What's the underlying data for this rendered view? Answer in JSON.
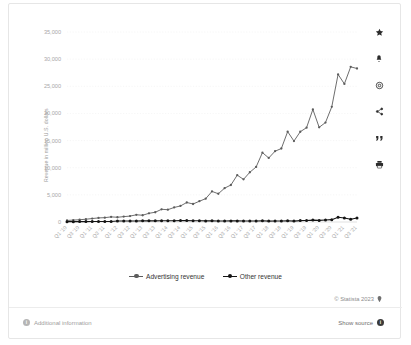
{
  "chart_data": {
    "type": "line",
    "title": "",
    "xlabel": "",
    "ylabel": "Revenue in million U.S. dollars",
    "ylim": [
      0,
      35000
    ],
    "yticks": [
      "0",
      "5,000",
      "10,000",
      "15,000",
      "20,000",
      "25,000",
      "30,000",
      "35,000"
    ],
    "ytick_values": [
      0,
      5000,
      10000,
      15000,
      20000,
      25000,
      30000,
      35000
    ],
    "grid": true,
    "legend_position": "bottom",
    "categories": [
      "Q1 '10",
      "Q2 '10",
      "Q3 '10",
      "Q4 '10",
      "Q1 '11",
      "Q2 '11",
      "Q3 '11",
      "Q4 '11",
      "Q1 '12",
      "Q2 '12",
      "Q3 '12",
      "Q4 '12",
      "Q1 '13",
      "Q2 '13",
      "Q3 '13",
      "Q4 '13",
      "Q1 '14",
      "Q2 '14",
      "Q3 '14",
      "Q4 '14",
      "Q1 '15",
      "Q2 '15",
      "Q3 '15",
      "Q4 '15",
      "Q1 '16",
      "Q2 '16",
      "Q3 '16",
      "Q4 '16",
      "Q1 '17",
      "Q2 '17",
      "Q3 '17",
      "Q4 '17",
      "Q1 '18",
      "Q2 '18",
      "Q3 '18",
      "Q4 '18",
      "Q1 '19",
      "Q2 '19",
      "Q3 '19",
      "Q4 '19",
      "Q1 '20",
      "Q2 '20",
      "Q3 '20",
      "Q4 '20",
      "Q1 '21",
      "Q2 '21",
      "Q3 '21"
    ],
    "xtick_labels": [
      "Q1 '10",
      "Q3 '10",
      "Q1 '11",
      "Q3 '11",
      "Q1 '12",
      "Q3 '12",
      "Q1 '13",
      "Q3 '13",
      "Q1 '14",
      "Q3 '14",
      "Q1 '15",
      "Q3 '15",
      "Q1 '16",
      "Q3 '16",
      "Q1 '17",
      "Q3 '17",
      "Q1 '18",
      "Q3 '18",
      "Q1 '19",
      "Q3 '19",
      "Q1 '20",
      "Q3 '20",
      "Q1 '21",
      "Q3 '21"
    ],
    "series": [
      {
        "name": "Advertising revenue",
        "color": "#5c5c5c",
        "values": [
          285,
          350,
          420,
          510,
          637,
          754,
          798,
          943,
          872,
          992,
          1086,
          1329,
          1245,
          1600,
          1798,
          2340,
          2265,
          2680,
          2958,
          3594,
          3317,
          3827,
          4299,
          5637,
          5201,
          6239,
          6816,
          8629,
          7857,
          9164,
          10142,
          12779,
          11795,
          13038,
          13539,
          16641,
          14912,
          16624,
          17383,
          20736,
          17440,
          18321,
          21221,
          27187,
          25439,
          28580,
          28276
        ]
      },
      {
        "name": "Other revenue",
        "color": "#141414",
        "values": [
          60,
          65,
          70,
          75,
          94,
          89,
          98,
          90,
          186,
          192,
          176,
          184,
          213,
          214,
          216,
          241,
          237,
          240,
          259,
          263,
          226,
          219,
          203,
          210,
          181,
          194,
          200,
          203,
          189,
          193,
          186,
          226,
          165,
          193,
          183,
          228,
          165,
          262,
          269,
          346,
          297,
          366,
          434,
          885,
          732,
          497,
          727
        ]
      }
    ]
  },
  "legend": {
    "items": [
      {
        "label": "Advertising revenue",
        "color": "#5c5c5c"
      },
      {
        "label": "Other revenue",
        "color": "#141414"
      }
    ]
  },
  "toolbar": {
    "icons": [
      {
        "name": "star-icon",
        "title": "Favorite"
      },
      {
        "name": "bell-icon",
        "title": "Notify"
      },
      {
        "name": "gear-icon",
        "title": "Settings"
      },
      {
        "name": "share-icon",
        "title": "Share"
      },
      {
        "name": "quote-icon",
        "title": "Cite"
      },
      {
        "name": "print-icon",
        "title": "Print"
      }
    ]
  },
  "footer": {
    "copyright": "© Statista 2023",
    "additional_information": "Additional information",
    "show_source": "Show source"
  }
}
